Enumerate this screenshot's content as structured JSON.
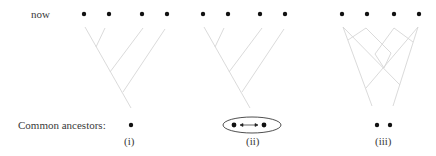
{
  "row_labels": {
    "now": "now",
    "common_ancestors": "Common ancestors:"
  },
  "panels": [
    {
      "id": "i",
      "label": "(i)",
      "leaves": 4,
      "common_ancestors": 1
    },
    {
      "id": "ii",
      "label": "(ii)",
      "leaves": 4,
      "common_ancestors": 2,
      "ancestor_relation": "double-arrow-in-ellipse"
    },
    {
      "id": "iii",
      "label": "(iii)",
      "leaves": 4,
      "common_ancestors": 2
    }
  ],
  "colors": {
    "dot": "#111111",
    "branch": "#d6d6d6",
    "text": "#3a3a3a"
  }
}
